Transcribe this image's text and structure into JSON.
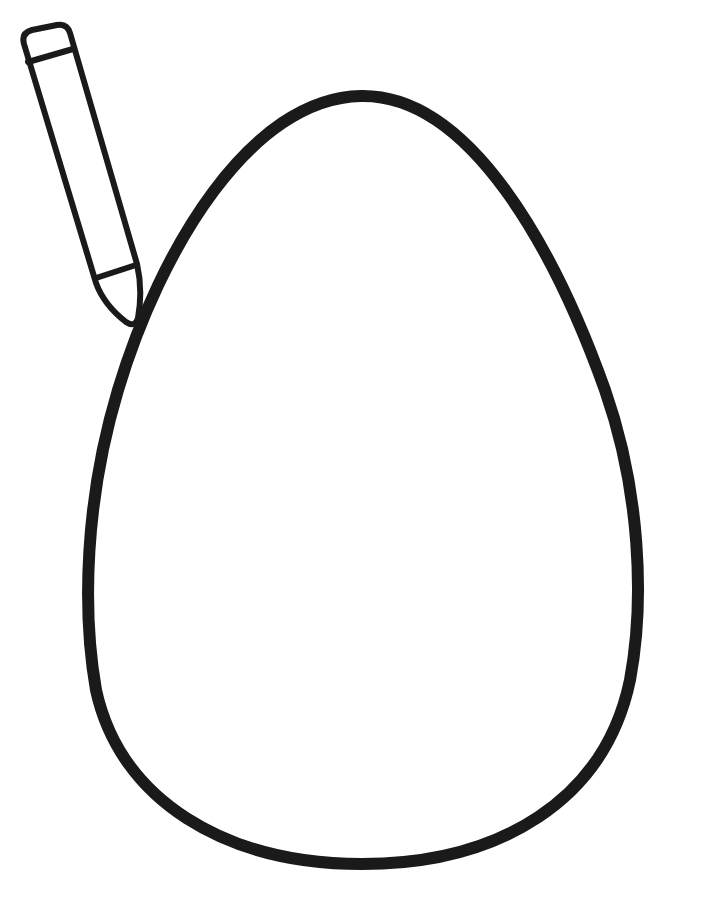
{
  "page": {
    "kind": "coloring-page",
    "background": "#ffffff",
    "stroke_color": "#1a1a1a"
  },
  "illustration": {
    "egg": {
      "label": "egg-outline",
      "stroke_width": 12
    },
    "crayon": {
      "label": "crayon",
      "stroke_width": 6
    }
  }
}
